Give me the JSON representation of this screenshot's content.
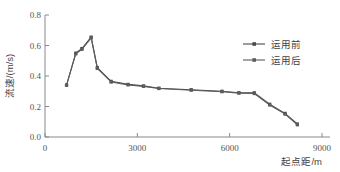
{
  "chart_data": {
    "type": "line",
    "title": "",
    "xlabel": "起点距/m",
    "ylabel": "流速/(m/s)",
    "xlim": [
      0,
      9000
    ],
    "ylim": [
      0.0,
      0.8
    ],
    "xticks": [
      "0",
      "3000",
      "6000",
      "9000"
    ],
    "xtick_values": [
      0,
      3000,
      6000,
      9000
    ],
    "yticks": [
      "0.0",
      "0.2",
      "0.4",
      "0.6",
      "0.8"
    ],
    "ytick_values": [
      0.0,
      0.2,
      0.4,
      0.6,
      0.8
    ],
    "grid": false,
    "legend_position": "upper right",
    "series": [
      {
        "name": "运用前",
        "color": "#4a4a4a",
        "marker": "square",
        "x": [
          700,
          1000,
          1200,
          1500,
          1700,
          2150,
          2700,
          3200,
          3700,
          4750,
          5750,
          6300,
          6800,
          7300,
          7800,
          8200
        ],
        "y": [
          0.34,
          0.55,
          0.58,
          0.655,
          0.455,
          0.365,
          0.345,
          0.335,
          0.32,
          0.31,
          0.3,
          0.29,
          0.29,
          0.215,
          0.155,
          0.085
        ]
      },
      {
        "name": "运用后",
        "color": "#5c5c5c",
        "marker": "square",
        "x": [
          700,
          1000,
          1200,
          1500,
          1700,
          2150,
          2700,
          3200,
          3700,
          4750,
          5750,
          6300,
          6800,
          7300,
          7800,
          8200
        ],
        "y": [
          0.34,
          0.545,
          0.575,
          0.65,
          0.45,
          0.36,
          0.342,
          0.332,
          0.318,
          0.307,
          0.297,
          0.288,
          0.285,
          0.21,
          0.15,
          0.08
        ]
      }
    ]
  },
  "legend": {
    "items": [
      {
        "label": "运用前"
      },
      {
        "label": "运用后"
      }
    ]
  },
  "axes": {
    "x_title": "起点距/m",
    "y_title": "流速/(m/s)"
  }
}
